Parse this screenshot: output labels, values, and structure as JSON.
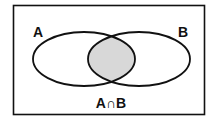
{
  "diagram": {
    "type": "venn",
    "sets": [
      {
        "label": "A",
        "shaded": false
      },
      {
        "label": "B",
        "shaded": false
      }
    ],
    "intersection": {
      "label": "A∩B",
      "shaded": true
    },
    "colors": {
      "stroke": "#111111",
      "fill_intersection": "#d8d8d8",
      "background": "#ffffff"
    }
  }
}
